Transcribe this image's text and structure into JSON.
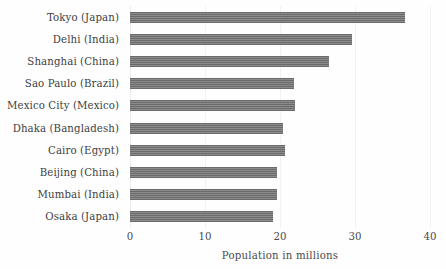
{
  "chart_data": {
    "type": "bar",
    "orientation": "horizontal",
    "title": "",
    "xlabel": "Population in millions",
    "ylabel": "t",
    "xlim": [
      0,
      40
    ],
    "xticks": [
      "0",
      "10",
      "20",
      "30",
      "40"
    ],
    "grid": true,
    "legend": null,
    "bar_color": "#6b6b6b",
    "categories": [
      "Tokyo (Japan)",
      "Delhi (India)",
      "Shanghai (China)",
      "Sao Paulo (Brazil)",
      "Mexico City (Mexico)",
      "Dhaka (Bangladesh)",
      "Cairo (Egypt)",
      "Beijing (China)",
      "Mumbai (India)",
      "Osaka (Japan)"
    ],
    "values": [
      36.7,
      29.6,
      26.5,
      21.8,
      22.0,
      20.4,
      20.7,
      19.6,
      19.6,
      19.1
    ]
  }
}
